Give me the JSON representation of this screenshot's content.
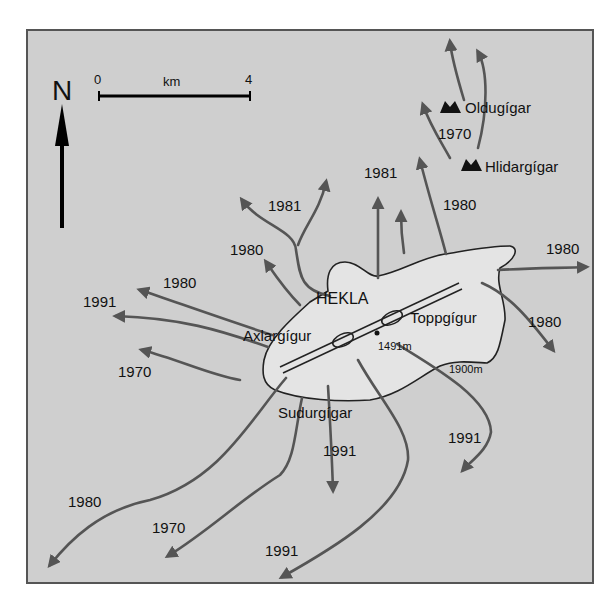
{
  "map": {
    "title": "HEKLA",
    "north_label": "N",
    "scale": {
      "start": "0",
      "end": "4",
      "unit": "km"
    },
    "craters": {
      "axlargigur": "Axlargígur",
      "toppgigur": "Toppgígur",
      "sudurgigar": "Sudurgígar",
      "oldugigar": "Oldugígar",
      "hlidargigar": "Hlidargígar"
    },
    "elevations": {
      "summit": "1491m",
      "contour": "1900m"
    },
    "flow_years": {
      "nw_1981": "1981",
      "nw_1980": "1980",
      "n_1981": "1981",
      "n_1980": "1980",
      "ne_1970": "1970",
      "e_1980": "1980",
      "se_1980": "1980",
      "w_1980": "1980",
      "w_1991": "1991",
      "w_1970": "1970",
      "sw_1980": "1980",
      "ssw_1970": "1970",
      "s_1991": "1991",
      "s_1991b": "1991",
      "se_1991": "1991"
    },
    "colors": {
      "background": "#cfcfcf",
      "summit_area": "#e4e4e4",
      "flow": "#555555",
      "text": "#111111"
    }
  }
}
